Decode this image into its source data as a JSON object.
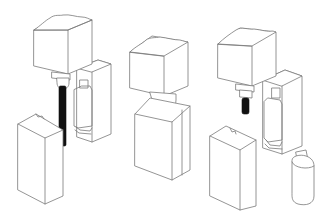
{
  "figure": {
    "type": "technical line illustration",
    "background": "#ffffff",
    "line_color": "#7a7a7a",
    "fill_dark": "#111111",
    "stages": [
      {
        "index": 1,
        "label": "stage-1-open-with-long-core",
        "components": [
          "mold-head-block",
          "core-rod-long-dark",
          "mold-half-with-cavity",
          "front-mold-half-open"
        ]
      },
      {
        "index": 2,
        "label": "stage-2-closed",
        "components": [
          "mold-head-block",
          "dome-nozzle",
          "closed-mold-block"
        ]
      },
      {
        "index": 3,
        "label": "stage-3-open-ejected",
        "components": [
          "mold-head-block",
          "core-rod-short-dark",
          "mold-half-with-cavity",
          "front-mold-half-open",
          "ejected-bottle"
        ]
      }
    ]
  }
}
